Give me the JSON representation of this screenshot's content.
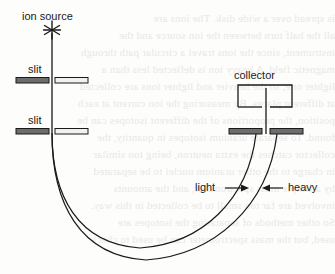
{
  "figure": {
    "background_color": "#fdfdfc",
    "ink_color": "#1a1a1a",
    "ghost_text_color": "#e9e8e6",
    "width": 335,
    "height": 274
  },
  "labels": {
    "ion_source": "ion source",
    "slit_upper": "slit",
    "slit_lower": "slit",
    "collector": "collector",
    "light": "light",
    "heavy": "heavy"
  },
  "components": {
    "ion_source_marker": "asterisk-burst",
    "slit_count": 3,
    "collector_shape": "open-bottom-rectangle",
    "beam_paths": 2
  },
  "ghost_text": {
    "lines": [
      "is spread over a wide disk. The ions are",
      "all the half turn between the ion source and the",
      "instrument, since the ions travel a circular path through",
      "magnetic field. A heavy ion is deflected less than a",
      "lighter one, so the heavier and lighter ions are collected",
      "at different places. By measuring the ion current at each",
      "position, the proportions of the different isotopes can be",
      "found. To separate uranium isotopes in quantity, the",
      "collector catches the extra neutron, being too similar",
      "in charge to the other uranium nuclei to be separated",
      "by a simple mass spectrometer, and the amounts",
      "involved are far too small to be collected in this way.",
      "So other methods of separating the isotopes are",
      "used, but the mass spectrometer can be used to check"
    ]
  }
}
